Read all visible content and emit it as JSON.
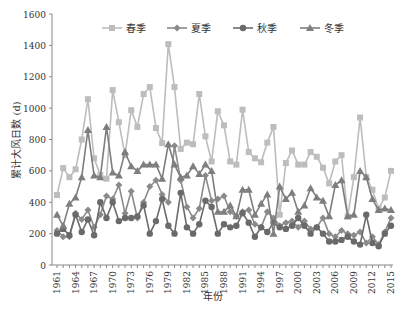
{
  "chart_data": {
    "type": "line",
    "title": "",
    "xlabel": "年份",
    "ylabel": "累计大风日数 (d)",
    "ylim": [
      0,
      1600
    ],
    "yticks": [
      0,
      200,
      400,
      600,
      800,
      1000,
      1200,
      1400,
      1600
    ],
    "xtick_labels": [
      "1961",
      "1964",
      "1967",
      "1970",
      "1973",
      "1976",
      "1979",
      "1982",
      "1985",
      "1988",
      "1991",
      "1994",
      "1997",
      "2000",
      "2003",
      "2006",
      "2009",
      "2012",
      "2015"
    ],
    "grid": false,
    "legend_position": "top",
    "x": [
      1961,
      1962,
      1963,
      1964,
      1965,
      1966,
      1967,
      1968,
      1969,
      1970,
      1971,
      1972,
      1973,
      1974,
      1975,
      1976,
      1977,
      1978,
      1979,
      1980,
      1981,
      1982,
      1983,
      1984,
      1985,
      1986,
      1987,
      1988,
      1989,
      1990,
      1991,
      1992,
      1993,
      1994,
      1995,
      1996,
      1997,
      1998,
      1999,
      2000,
      2001,
      2002,
      2003,
      2004,
      2005,
      2006,
      2007,
      2008,
      2009,
      2010,
      2011,
      2012,
      2013,
      2014,
      2015
    ],
    "series": [
      {
        "name": "春季",
        "marker": "square",
        "color": "#bdbdbd",
        "values": [
          446,
          618,
          560,
          610,
          800,
          1057,
          680,
          573,
          550,
          1115,
          910,
          700,
          987,
          880,
          1090,
          1134,
          873,
          777,
          1408,
          1134,
          740,
          780,
          770,
          1090,
          820,
          660,
          980,
          890,
          660,
          640,
          990,
          720,
          680,
          655,
          780,
          880,
          320,
          650,
          730,
          640,
          640,
          720,
          690,
          620,
          520,
          660,
          700,
          310,
          560,
          940,
          560,
          480,
          360,
          430,
          600
        ]
      },
      {
        "name": "夏季",
        "marker": "diamond",
        "color": "#8a8a8a",
        "values": [
          220,
          180,
          180,
          330,
          290,
          350,
          240,
          320,
          440,
          420,
          510,
          330,
          470,
          300,
          400,
          500,
          540,
          450,
          400,
          760,
          540,
          370,
          300,
          360,
          570,
          410,
          420,
          440,
          340,
          310,
          340,
          350,
          260,
          240,
          340,
          300,
          250,
          270,
          280,
          240,
          280,
          230,
          240,
          300,
          200,
          180,
          220,
          200,
          190,
          210,
          140,
          180,
          130,
          210,
          300
        ]
      },
      {
        "name": "秋季",
        "marker": "circle",
        "color": "#6a6a6a",
        "values": [
          200,
          230,
          190,
          320,
          210,
          290,
          190,
          400,
          300,
          400,
          280,
          300,
          300,
          310,
          380,
          200,
          280,
          420,
          250,
          200,
          460,
          240,
          200,
          260,
          410,
          370,
          200,
          260,
          240,
          250,
          330,
          270,
          180,
          240,
          210,
          270,
          240,
          230,
          250,
          300,
          250,
          200,
          240,
          200,
          150,
          150,
          160,
          180,
          150,
          130,
          320,
          140,
          120,
          200,
          250
        ]
      },
      {
        "name": "冬季",
        "marker": "triangle",
        "color": "#7e7e7e",
        "values": [
          320,
          250,
          390,
          430,
          560,
          860,
          570,
          560,
          880,
          590,
          570,
          720,
          630,
          600,
          640,
          640,
          640,
          550,
          770,
          640,
          560,
          570,
          630,
          580,
          640,
          600,
          340,
          340,
          380,
          310,
          480,
          480,
          320,
          390,
          450,
          200,
          500,
          420,
          460,
          340,
          380,
          490,
          430,
          410,
          310,
          510,
          540,
          310,
          320,
          600,
          560,
          420,
          350,
          360,
          350
        ]
      }
    ]
  }
}
